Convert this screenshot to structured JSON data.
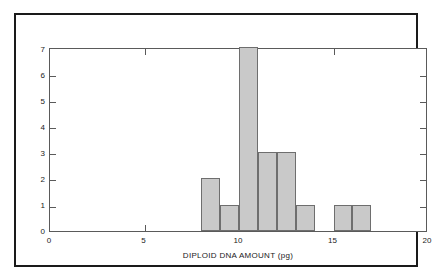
{
  "chart_data": {
    "type": "bar",
    "title": "",
    "subtitle": "",
    "xlabel": "DIPLOID DNA AMOUNT (pg)",
    "ylabel": "NUMBER OF SPECIES",
    "xlim": [
      0,
      20
    ],
    "ylim": [
      0,
      7
    ],
    "grid": false,
    "legend": null,
    "x_ticks": [
      0,
      5,
      10,
      15,
      20
    ],
    "x_tick_labels": [
      "0",
      "5",
      "10",
      "15",
      "20"
    ],
    "y_ticks": [
      0,
      1,
      2,
      3,
      4,
      5,
      6,
      7
    ],
    "y_tick_labels": [
      "0",
      "1",
      "2",
      "3",
      "4",
      "5",
      "6",
      "7"
    ],
    "bin_width": 1,
    "bins": [
      {
        "start": 8,
        "end": 9,
        "count": 2
      },
      {
        "start": 9,
        "end": 10,
        "count": 1
      },
      {
        "start": 10,
        "end": 11,
        "count": 7
      },
      {
        "start": 11,
        "end": 12,
        "count": 3
      },
      {
        "start": 12,
        "end": 13,
        "count": 3
      },
      {
        "start": 13,
        "end": 14,
        "count": 1
      },
      {
        "start": 14,
        "end": 15,
        "count": 0
      },
      {
        "start": 15,
        "end": 16,
        "count": 1
      },
      {
        "start": 16,
        "end": 17,
        "count": 1
      }
    ],
    "categories": [
      "8-9",
      "9-10",
      "10-11",
      "11-12",
      "12-13",
      "13-14",
      "14-15",
      "15-16",
      "16-17"
    ],
    "values": [
      2,
      1,
      7,
      3,
      3,
      1,
      0,
      1,
      1
    ],
    "colors": {
      "bar_fill": "#c9c9c9",
      "bar_edge": "#6e6e6e",
      "axis": "#5a5a5a",
      "text": "#1a1a1a",
      "frame": "#1a1a1a",
      "background": "#ffffff"
    }
  }
}
